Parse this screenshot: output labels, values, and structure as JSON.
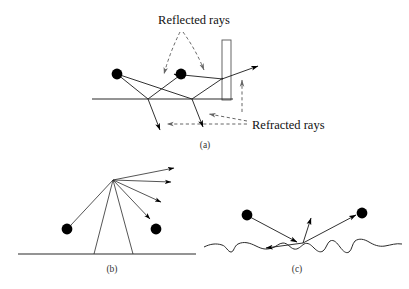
{
  "figure": {
    "title_visible": false,
    "background_color": "#ffffff",
    "ink_color": "#000000",
    "dashed_color": "#555555",
    "panels": [
      {
        "id": "a",
        "label": "(a)",
        "label_x": 205,
        "label_y": 148,
        "annotations": [
          {
            "name": "reflected-rays-label",
            "text": "Reflected rays",
            "x": 194,
            "y": 24,
            "anchor": "middle"
          },
          {
            "name": "refracted-rays-label",
            "text": "Refracted rays",
            "x": 252,
            "y": 129,
            "anchor": "start"
          }
        ],
        "ground_line": {
          "x1": 92,
          "y1": 99,
          "x2": 233,
          "y2": 99
        },
        "wall": {
          "x": 222,
          "y": 40,
          "width": 9,
          "height": 60
        },
        "dots": [
          {
            "name": "light-source-dot-left",
            "cx": 117,
            "cy": 74,
            "r": 5.4
          },
          {
            "name": "light-source-dot-right",
            "cx": 181,
            "cy": 74,
            "r": 5.4
          }
        ],
        "solid_rays": [
          {
            "name": "ray-source-left-to-ground-a",
            "points": "117,74 148,99"
          },
          {
            "name": "ray-ground-a-to-dot-right",
            "points": "148,99 181,74"
          },
          {
            "name": "ray-source-left-to-ground-b",
            "points": "117,74 192,99"
          },
          {
            "name": "ray-ground-b-to-wall",
            "points": "192,99 222,78"
          },
          {
            "name": "ray-wall-to-exit-up",
            "points": "222,78 259,66"
          },
          {
            "name": "ray-dot-right-to-wall",
            "points": "181,74 222,78"
          }
        ],
        "arrow_rays": [
          {
            "name": "refracted-down-left-arrow",
            "points": "148,99 161,132"
          },
          {
            "name": "refracted-down-right-arrow",
            "points": "192,99 204,129"
          },
          {
            "name": "exit-ray-upper-right-arrow",
            "points": "222,78 259,66"
          }
        ],
        "dashed_rays": [
          {
            "name": "reflected-dashed-left-arrow",
            "points": "180,32 163,78"
          },
          {
            "name": "reflected-dashed-right-arrow",
            "points": "182,32 205,73"
          },
          {
            "name": "refracted-dashed-vertical-arrow",
            "points": "242,110 242,78"
          },
          {
            "name": "refracted-dashed-horizontal-arrow",
            "points": "248,124 165,124"
          },
          {
            "name": "refracted-dashed-to-hitpoint-arrow",
            "points": "248,122 208,114"
          }
        ]
      },
      {
        "id": "b",
        "label": "(b)",
        "label_x": 112,
        "label_y": 272,
        "ground_line": {
          "x1": 18,
          "y1": 254,
          "x2": 196,
          "y2": 254
        },
        "vertex": {
          "x": 113,
          "y": 180
        },
        "dots": [
          {
            "name": "incoming-photon-dot",
            "cx": 67,
            "cy": 229,
            "r": 5.4
          },
          {
            "name": "outgoing-photon-dot",
            "cx": 156,
            "cy": 229,
            "r": 5.4
          }
        ],
        "fan_arrows": [
          {
            "name": "scatter-arrow-1",
            "points": "113,180 176,168"
          },
          {
            "name": "scatter-arrow-2",
            "points": "113,180 173,182"
          },
          {
            "name": "scatter-arrow-3",
            "points": "113,180 163,203"
          },
          {
            "name": "scatter-arrow-4",
            "points": "113,180 152,221"
          }
        ],
        "fan_lines": [
          {
            "name": "fan-line-to-incoming-dot",
            "points": "113,180 70,226"
          },
          {
            "name": "fan-line-left-ground",
            "points": "113,180 94,254"
          },
          {
            "name": "fan-line-right-ground",
            "points": "113,180 133,254"
          }
        ]
      },
      {
        "id": "c",
        "label": "(c)",
        "label_x": 297,
        "label_y": 272,
        "rough_surface_path": "M 204,247 C 210,244 216,243 222,245 C 226,246 228,252 231,252 C 234,252 234,246 238,244 C 244,241 250,243 256,246 C 262,249 266,250 272,248 C 276,247 279,243 283,243 C 288,243 290,248 294,249 C 298,250 301,246 304,244 C 308,242 311,245 314,248 C 317,251 320,253 323,251 C 326,249 327,243 330,241 C 334,239 337,243 340,247 C 343,251 346,254 349,252 C 352,250 352,244 355,241 C 359,238 364,239 369,242 C 374,245 379,247 385,246 C 391,245 396,243 402,244",
        "scatter_point": {
          "x": 303,
          "y": 243
        },
        "dots": [
          {
            "name": "incoming-photon-dot",
            "cx": 247,
            "cy": 215,
            "r": 5.4
          },
          {
            "name": "outgoing-photon-dot",
            "cx": 362,
            "cy": 213,
            "r": 5.4
          }
        ],
        "arrow_rays": [
          {
            "name": "incident-ray-arrow",
            "points": "247,215 295,241"
          },
          {
            "name": "scatter-arrow-left",
            "points": "303,243 264,248"
          },
          {
            "name": "scatter-arrow-up",
            "points": "303,243 311,216"
          },
          {
            "name": "scatter-arrow-right",
            "points": "303,243 358,214"
          }
        ]
      }
    ]
  }
}
